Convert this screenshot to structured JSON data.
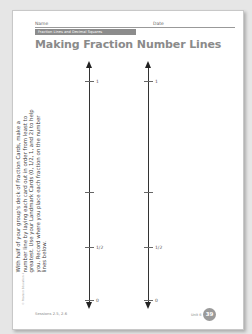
{
  "header": {
    "name_label": "Name",
    "date_label": "Date",
    "banner": "Fraction Lines and Decimal Squares"
  },
  "title": "Making Fraction Number Lines",
  "instructions": "With half of your group's deck of Fraction Cards, make a number line by laying each card out in order from least to greatest. Use your Landmark Cards (0, 1/2, 1, and 2) to help you. Record where you place each fraction on the number lines below.",
  "copyright": "© Pearson Education 4",
  "number_lines": [
    {
      "ticks": [
        {
          "label": "1",
          "pos": 14
        },
        {
          "label": "",
          "pos": 125
        },
        {
          "label": "1/2",
          "pos": 180
        },
        {
          "label": "0",
          "pos": 233
        }
      ]
    },
    {
      "ticks": [
        {
          "label": "1",
          "pos": 14
        },
        {
          "label": "",
          "pos": 125
        },
        {
          "label": "1/2",
          "pos": 180
        },
        {
          "label": "0",
          "pos": 233
        }
      ]
    }
  ],
  "footer": {
    "sessions": "Sessions 2.5, 2.6",
    "unit": "Unit 6",
    "page_number": "39"
  },
  "colors": {
    "banner": "#8c8c8c",
    "title": "#8a8a8a",
    "page_badge": "#9a9a9a"
  }
}
